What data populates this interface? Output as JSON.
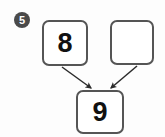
{
  "problem": {
    "number_label": "5",
    "type": "number-bond-addition",
    "boxes": [
      {
        "id": "addend-1",
        "value": "8",
        "filled": true
      },
      {
        "id": "addend-2",
        "value": "",
        "filled": false
      },
      {
        "id": "sum",
        "value": "9",
        "filled": true
      }
    ],
    "arrows": [
      {
        "id": "arrow-left",
        "from": "addend-1",
        "to": "sum"
      },
      {
        "id": "arrow-right",
        "from": "addend-2",
        "to": "sum"
      }
    ]
  },
  "colors": {
    "page_background": "#fdfdfd",
    "box_border": "#555555",
    "box_fill": "#ffffff",
    "digit": "#111111",
    "badge_fill": "#4a4a4a",
    "badge_text": "#fdfdfd",
    "arrow": "#2b2b2b"
  }
}
